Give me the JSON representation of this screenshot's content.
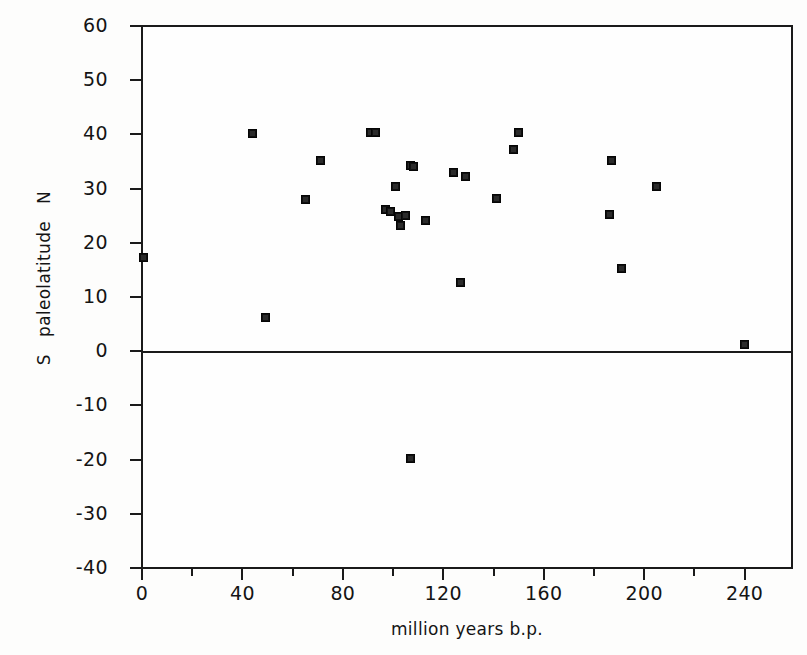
{
  "figure": {
    "background": "#fdfdfc",
    "ink": "#141414"
  },
  "chart_data": {
    "type": "scatter",
    "title": "",
    "xlabel": "million years b.p.",
    "ylabel": "S   paleolatitude   N",
    "xlim": [
      0,
      260
    ],
    "ylim": [
      -40,
      60
    ],
    "xticks": [
      0,
      40,
      80,
      120,
      160,
      200,
      240
    ],
    "xticklabels": [
      "0",
      "40",
      "80",
      "120",
      "160",
      "200",
      "240"
    ],
    "xminorticks": [
      20,
      60,
      100,
      140,
      180,
      220
    ],
    "yticks": [
      -40,
      -30,
      -20,
      -10,
      0,
      10,
      20,
      30,
      40,
      50,
      60
    ],
    "yticklabels": [
      "-40",
      "-30",
      "-20",
      "-10",
      "0",
      "10",
      "20",
      "30",
      "40",
      "50",
      "60"
    ],
    "grid": false,
    "legend": null,
    "zero_line": 0,
    "marker": "filled-square",
    "marker_color": "#101010",
    "points": [
      {
        "x": 0.5,
        "y": 17.2
      },
      {
        "x": 44,
        "y": 40.2
      },
      {
        "x": 49,
        "y": 6.3
      },
      {
        "x": 65,
        "y": 28.0
      },
      {
        "x": 71,
        "y": 35.1
      },
      {
        "x": 91,
        "y": 40.3
      },
      {
        "x": 93,
        "y": 40.3
      },
      {
        "x": 97,
        "y": 26.2
      },
      {
        "x": 99,
        "y": 25.8
      },
      {
        "x": 101,
        "y": 30.3
      },
      {
        "x": 102,
        "y": 24.8
      },
      {
        "x": 103,
        "y": 23.2
      },
      {
        "x": 105,
        "y": 25.0
      },
      {
        "x": 107,
        "y": 34.2
      },
      {
        "x": 108,
        "y": 34.1
      },
      {
        "x": 107,
        "y": -19.8
      },
      {
        "x": 113,
        "y": 24.2
      },
      {
        "x": 124,
        "y": 33.0
      },
      {
        "x": 127,
        "y": 12.7
      },
      {
        "x": 129,
        "y": 32.2
      },
      {
        "x": 141,
        "y": 28.2
      },
      {
        "x": 148,
        "y": 37.3
      },
      {
        "x": 150,
        "y": 40.4
      },
      {
        "x": 186,
        "y": 25.2
      },
      {
        "x": 187,
        "y": 35.2
      },
      {
        "x": 191,
        "y": 15.2
      },
      {
        "x": 205,
        "y": 30.4
      },
      {
        "x": 240,
        "y": 1.3
      }
    ]
  }
}
